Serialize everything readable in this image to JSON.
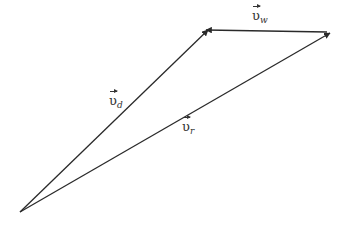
{
  "diagram": {
    "colors": {
      "line": "#2a2a2a",
      "text": "#333333",
      "background": "#ffffff"
    },
    "origin": {
      "x": 20,
      "y": 212
    },
    "vectors": [
      {
        "id": "v_d",
        "symbol": "υ",
        "subscript": "d",
        "from": [
          20,
          212
        ],
        "to": [
          208,
          30
        ],
        "label_pos": [
          109,
          94
        ]
      },
      {
        "id": "v_w",
        "symbol": "υ",
        "subscript": "w",
        "from": [
          327,
          32
        ],
        "to": [
          206,
          30
        ],
        "label_pos": [
          252,
          9
        ]
      },
      {
        "id": "v_r",
        "symbol": "υ",
        "subscript": "r",
        "from": [
          20,
          212
        ],
        "to": [
          330,
          33
        ],
        "label_pos": [
          182,
          120
        ]
      }
    ]
  },
  "labels": {
    "v_d": {
      "base": "υ",
      "sub": "d"
    },
    "v_w": {
      "base": "υ",
      "sub": "w"
    },
    "v_r": {
      "base": "υ",
      "sub": "r"
    }
  }
}
